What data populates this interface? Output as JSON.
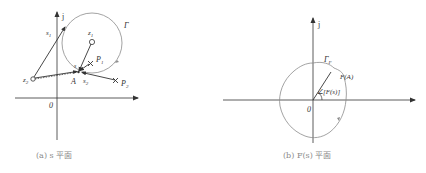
{
  "panels": [
    {
      "id": "s-plane",
      "caption": "(a) s 平面",
      "labels": {
        "j_axis": "j",
        "origin": "0",
        "contour": "Γ",
        "s1": "s",
        "s1_sub": "1",
        "s2": "s",
        "s2_sub": "2",
        "z1": "z",
        "z1_sub": "1",
        "z2": "z",
        "z2_sub": "2",
        "p1": "P",
        "p1_sub": "1",
        "p2": "P",
        "p2_sub": "2",
        "s_point": "s",
        "a_point": "A"
      }
    },
    {
      "id": "F-plane",
      "caption": "(b) F(s) 平面",
      "labels": {
        "j_axis": "j",
        "origin": "0",
        "contour": "Γ",
        "contour_sub": "F",
        "fa": "F(A)",
        "angle": "∠[F(s)]"
      }
    }
  ],
  "colors": {
    "stroke": "#333333",
    "contour": "#8c8c8c",
    "caption": "#8a8a8a"
  }
}
